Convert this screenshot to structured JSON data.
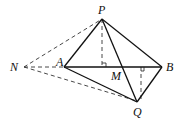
{
  "diagram": {
    "type": "geometry",
    "points": {
      "P": {
        "label": "P",
        "x": 102,
        "y": 19
      },
      "N": {
        "label": "N",
        "x": 23,
        "y": 67
      },
      "A": {
        "label": "A",
        "x": 64,
        "y": 67
      },
      "B": {
        "label": "B",
        "x": 163,
        "y": 67
      },
      "M": {
        "label": "M",
        "x": 124,
        "y": 67
      },
      "Q": {
        "label": "Q",
        "x": 138,
        "y": 102
      },
      "H1": {
        "label": "",
        "x": 102,
        "y": 67
      },
      "H2": {
        "label": "",
        "x": 138,
        "y": 67
      }
    },
    "solid_segments": [
      [
        "P",
        "A"
      ],
      [
        "P",
        "B"
      ],
      [
        "A",
        "B"
      ],
      [
        "P",
        "Q"
      ],
      [
        "A",
        "Q"
      ],
      [
        "B",
        "Q"
      ]
    ],
    "dashed_segments": [
      [
        "N",
        "P"
      ],
      [
        "N",
        "A"
      ],
      [
        "N",
        "Q"
      ],
      [
        "P",
        "H1"
      ],
      [
        "Q",
        "H2"
      ]
    ],
    "right_angles": [
      "H1",
      "H2"
    ],
    "labels": {
      "P": "P",
      "N": "N",
      "A": "A",
      "B": "B",
      "M": "M",
      "Q": "Q"
    }
  }
}
